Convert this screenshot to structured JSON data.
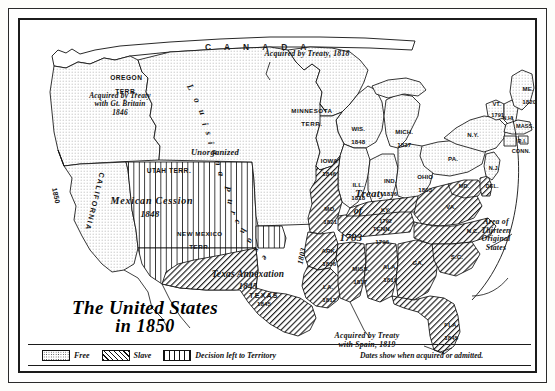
{
  "figure": {
    "title_line1": "The United States",
    "title_line2": "in 1850",
    "canada_label": "CANADA",
    "note": "Dates show when acquired or admitted."
  },
  "legend": {
    "items": [
      {
        "key": "free",
        "label": "Free",
        "pattern": "dotted"
      },
      {
        "key": "slave",
        "label": "Slave",
        "pattern": "diagonal-hatch"
      },
      {
        "key": "territory",
        "label": "Decision left to Territory",
        "pattern": "vertical-lines"
      }
    ]
  },
  "annotations": [
    {
      "key": "oregon_treaty",
      "text": "Acquired by Treaty\nwith Gt. Britain\n1846"
    },
    {
      "key": "treaty_1818",
      "text": "Acquired by Treaty, 1818"
    },
    {
      "key": "spain_1819",
      "text": "Acquired by Treaty\nwith Spain, 1819"
    },
    {
      "key": "thirteen",
      "text": "Area of\nThirteen\nOriginal\nStates"
    },
    {
      "key": "mexican_cession",
      "text": "Mexican Cession"
    },
    {
      "key": "mexican_cession_year",
      "text": "1848"
    },
    {
      "key": "texas_annexation",
      "text": "Texas Annexation"
    },
    {
      "key": "texas_annexation_year",
      "text": "1845"
    },
    {
      "key": "unorganized",
      "text": "Unorganized"
    },
    {
      "key": "louisiana_purchase",
      "text": "Louisiana Purchase"
    },
    {
      "key": "treaty_of_1783_l1",
      "text": "Treaty"
    },
    {
      "key": "treaty_of_1783_l2",
      "text": "of"
    },
    {
      "key": "treaty_of_1783_l3",
      "text": "1783"
    },
    {
      "key": "purchase_1803",
      "text": "1803"
    }
  ],
  "territories": [
    {
      "key": "oregon",
      "name": "OREGON",
      "sub": "TERR.",
      "status": "free"
    },
    {
      "key": "minnesota",
      "name": "MINNESOTA",
      "sub": "TERR.",
      "status": "free"
    },
    {
      "key": "utah",
      "name": "UTAH TERR.",
      "sub": "",
      "status": "territory"
    },
    {
      "key": "new_mexico",
      "name": "NEW MEXICO",
      "sub": "TERR.",
      "status": "territory"
    }
  ],
  "states": [
    {
      "key": "california",
      "abbr": "CALIFORNIA",
      "year": "1850",
      "status": "free"
    },
    {
      "key": "texas",
      "abbr": "TEXAS",
      "year": "1845",
      "status": "slave"
    },
    {
      "key": "wisconsin",
      "abbr": "WIS.",
      "year": "1848",
      "status": "free"
    },
    {
      "key": "michigan",
      "abbr": "MICH.",
      "year": "1837",
      "status": "free"
    },
    {
      "key": "iowa",
      "abbr": "IOWA",
      "year": "1846",
      "status": "free"
    },
    {
      "key": "illinois",
      "abbr": "ILL.",
      "year": "1818",
      "status": "free"
    },
    {
      "key": "indiana",
      "abbr": "IND.",
      "year": "1816",
      "status": "free"
    },
    {
      "key": "ohio",
      "abbr": "OHIO",
      "year": "1803",
      "status": "free"
    },
    {
      "key": "missouri",
      "abbr": "MO.",
      "year": "1821",
      "status": "slave"
    },
    {
      "key": "arkansas",
      "abbr": "ARK.",
      "year": "1836",
      "status": "slave"
    },
    {
      "key": "louisiana",
      "abbr": "LA.",
      "year": "1812",
      "status": "slave"
    },
    {
      "key": "mississippi",
      "abbr": "MISS.",
      "year": "1817",
      "status": "slave"
    },
    {
      "key": "alabama",
      "abbr": "ALA.",
      "year": "1819",
      "status": "slave"
    },
    {
      "key": "georgia",
      "abbr": "GA.",
      "year": "",
      "status": "slave"
    },
    {
      "key": "florida",
      "abbr": "FLA.",
      "year": "1845",
      "status": "slave"
    },
    {
      "key": "tennessee",
      "abbr": "TENN.",
      "year": "1796",
      "status": "slave"
    },
    {
      "key": "kentucky",
      "abbr": "KY.",
      "year": "1792",
      "status": "slave"
    },
    {
      "key": "virginia",
      "abbr": "VA.",
      "year": "",
      "status": "slave"
    },
    {
      "key": "north_carolina",
      "abbr": "N.C.",
      "year": "",
      "status": "slave"
    },
    {
      "key": "south_carolina",
      "abbr": "S.C.",
      "year": "",
      "status": "slave"
    },
    {
      "key": "maryland",
      "abbr": "MD.",
      "year": "",
      "status": "slave"
    },
    {
      "key": "delaware",
      "abbr": "DEL.",
      "year": "",
      "status": "slave"
    },
    {
      "key": "pennsylvania",
      "abbr": "PA.",
      "year": "",
      "status": "free"
    },
    {
      "key": "new_jersey",
      "abbr": "N.J.",
      "year": "",
      "status": "free"
    },
    {
      "key": "new_york",
      "abbr": "N.Y.",
      "year": "",
      "status": "free"
    },
    {
      "key": "vermont",
      "abbr": "VT.",
      "year": "1791",
      "status": "free"
    },
    {
      "key": "new_hampshire",
      "abbr": "N.H.",
      "year": "",
      "status": "free"
    },
    {
      "key": "maine",
      "abbr": "ME.",
      "year": "1820",
      "status": "free"
    },
    {
      "key": "massachusetts",
      "abbr": "MASS.",
      "year": "",
      "status": "free"
    },
    {
      "key": "rhode_island",
      "abbr": "R.I.",
      "year": "",
      "status": "free"
    },
    {
      "key": "connecticut",
      "abbr": "CONN.",
      "year": "",
      "status": "free"
    }
  ],
  "colors": {
    "ink": "#141414",
    "paper": "#ffffff",
    "frame": "#1b1b1b"
  }
}
